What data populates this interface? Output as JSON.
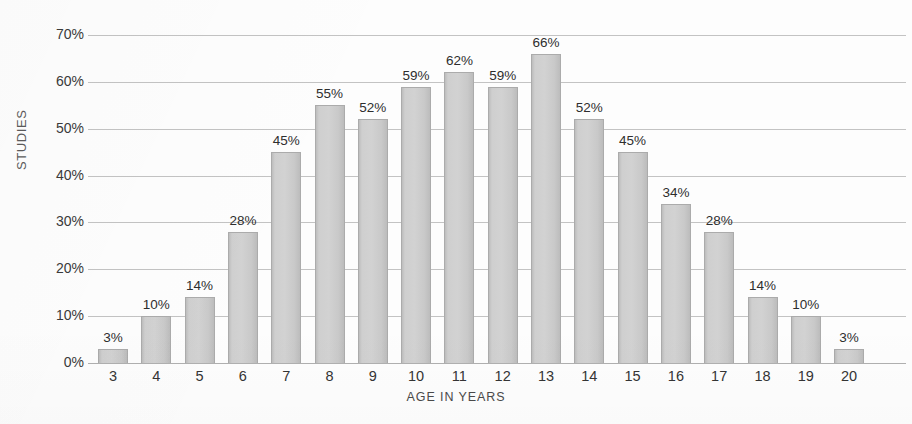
{
  "chart_data": {
    "type": "bar",
    "title": "",
    "xlabel": "AGE IN YEARS",
    "ylabel": "STUDIES",
    "categories": [
      "3",
      "4",
      "5",
      "6",
      "7",
      "8",
      "9",
      "10",
      "11",
      "12",
      "13",
      "14",
      "15",
      "16",
      "17",
      "18",
      "19",
      "20"
    ],
    "values": [
      3,
      10,
      14,
      28,
      45,
      55,
      52,
      59,
      62,
      59,
      66,
      52,
      45,
      34,
      28,
      14,
      10,
      3
    ],
    "value_labels": [
      "3%",
      "10%",
      "14%",
      "28%",
      "45%",
      "55%",
      "52%",
      "59%",
      "62%",
      "59%",
      "66%",
      "52%",
      "45%",
      "34%",
      "28%",
      "14%",
      "10%",
      "3%"
    ],
    "ylim": [
      0,
      70
    ],
    "ytick_values": [
      0,
      10,
      20,
      30,
      40,
      50,
      60,
      70
    ],
    "ytick_labels": [
      "0%",
      "10%",
      "20%",
      "30%",
      "40%",
      "50%",
      "60%",
      "70%"
    ],
    "grid": true,
    "grid_axis": "y",
    "legend": false,
    "legend_position": "none",
    "colors": {
      "bar_fill": "#d2d2d2",
      "bar_edge": "#ababab",
      "gridline": "#c3c3c3",
      "axis_text": "#343434",
      "label_text": "#2e2e2e",
      "background": "#fdfdfd"
    }
  }
}
